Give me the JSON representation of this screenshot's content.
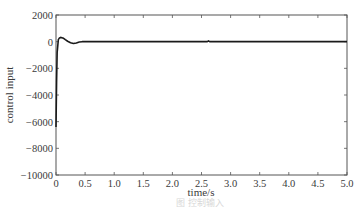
{
  "chart_data": {
    "type": "line",
    "title": "",
    "xlabel": "time/s",
    "ylabel": "control input",
    "xlim": [
      0,
      5.0
    ],
    "ylim": [
      -10000,
      2000
    ],
    "xticks": [
      0,
      0.5,
      1.0,
      1.5,
      2.0,
      2.5,
      3.0,
      3.5,
      4.0,
      4.5,
      5.0
    ],
    "xtick_labels": [
      "0",
      "0.5",
      "1.0",
      "1.5",
      "2.0",
      "2.5",
      "3.0",
      "3.5",
      "4.0",
      "4.5",
      "5.0"
    ],
    "yticks": [
      2000,
      0,
      -2000,
      -4000,
      -6000,
      -8000,
      -10000
    ],
    "ytick_labels": [
      "2000",
      "0",
      "−2000",
      "−4000",
      "−6000",
      "−8000",
      "−10000"
    ],
    "grid": false,
    "legend": null,
    "series": [
      {
        "name": "control input",
        "color": "#1a1a1a",
        "x": [
          0,
          0.01,
          0.02,
          0.04,
          0.06,
          0.08,
          0.1,
          0.13,
          0.16,
          0.2,
          0.25,
          0.3,
          0.35,
          0.4,
          0.45,
          0.5,
          0.7,
          1.0,
          1.5,
          2.0,
          2.5,
          2.6,
          2.62,
          2.64,
          2.7,
          3.0,
          3.5,
          4.0,
          4.5,
          5.0
        ],
        "y": [
          -6400,
          -3000,
          -800,
          150,
          280,
          320,
          300,
          250,
          150,
          30,
          -80,
          -140,
          -100,
          -30,
          0,
          10,
          0,
          0,
          0,
          0,
          0,
          0,
          60,
          0,
          0,
          0,
          0,
          0,
          0,
          0
        ]
      }
    ],
    "caption": "图 控制输入"
  }
}
